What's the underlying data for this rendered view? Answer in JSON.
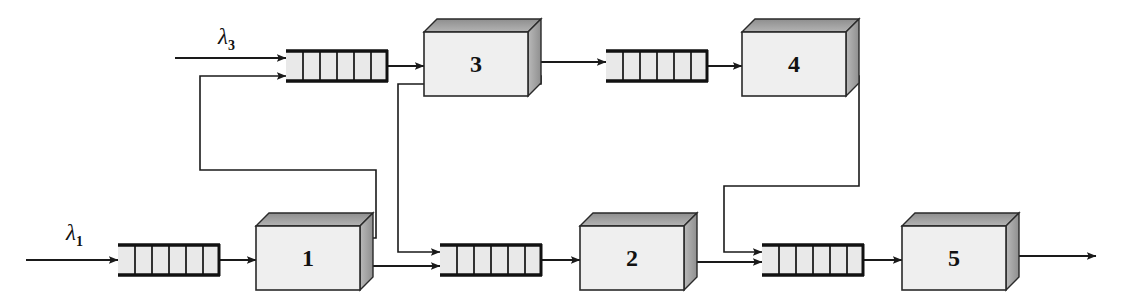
{
  "diagram": {
    "type": "queueing-network",
    "colors": {
      "line": "#1a1a1a",
      "server_face": "#efefef",
      "server_top": "#9a9a9a",
      "server_side": "#a8a8a8",
      "queue_fill": "#e9e9e9",
      "background": "#ffffff"
    },
    "arrivals": [
      {
        "id": "lambda3",
        "label": "λ",
        "subscript": "3",
        "x": 218,
        "y": 28
      },
      {
        "id": "lambda1",
        "label": "λ",
        "subscript": "1",
        "x": 66,
        "y": 224
      }
    ],
    "queues": [
      {
        "id": "queue3",
        "cells": 6,
        "x": 286,
        "y": 50,
        "width": 102,
        "height": 32
      },
      {
        "id": "queue4",
        "cells": 6,
        "x": 606,
        "y": 50,
        "width": 102,
        "height": 32
      },
      {
        "id": "queue1",
        "cells": 6,
        "x": 118,
        "y": 244,
        "width": 102,
        "height": 32
      },
      {
        "id": "queue2",
        "cells": 6,
        "x": 440,
        "y": 244,
        "width": 102,
        "height": 32
      },
      {
        "id": "queue5",
        "cells": 6,
        "x": 762,
        "y": 244,
        "width": 102,
        "height": 32
      }
    ],
    "servers": [
      {
        "id": "server3",
        "label": "3",
        "x": 424,
        "y": 32,
        "width": 104,
        "height": 64,
        "depth": 13
      },
      {
        "id": "server4",
        "label": "4",
        "x": 742,
        "y": 32,
        "width": 104,
        "height": 64,
        "depth": 13
      },
      {
        "id": "server1",
        "label": "1",
        "x": 256,
        "y": 226,
        "width": 104,
        "height": 64,
        "depth": 13
      },
      {
        "id": "server2",
        "label": "2",
        "x": 580,
        "y": 226,
        "width": 104,
        "height": 64,
        "depth": 13
      },
      {
        "id": "server5",
        "label": "5",
        "x": 902,
        "y": 226,
        "width": 104,
        "height": 64,
        "depth": 13
      }
    ],
    "flows": [
      {
        "id": "arrival3-to-queue3",
        "from": "lambda3",
        "to": "queue3"
      },
      {
        "id": "feedback1-to-queue3",
        "from": "server1",
        "to": "queue3"
      },
      {
        "id": "queue3-to-server3",
        "from": "queue3",
        "to": "server3"
      },
      {
        "id": "server3-to-queue4",
        "from": "server3",
        "to": "queue4"
      },
      {
        "id": "server3-to-queue2",
        "from": "server3",
        "to": "queue2"
      },
      {
        "id": "queue4-to-server4",
        "from": "queue4",
        "to": "server4"
      },
      {
        "id": "server4-to-queue5",
        "from": "server4",
        "to": "queue5"
      },
      {
        "id": "arrival1-to-queue1",
        "from": "lambda1",
        "to": "queue1"
      },
      {
        "id": "queue1-to-server1",
        "from": "queue1",
        "to": "server1"
      },
      {
        "id": "server1-to-queue2",
        "from": "server1",
        "to": "queue2"
      },
      {
        "id": "queue2-to-server2",
        "from": "queue2",
        "to": "server2"
      },
      {
        "id": "server2-to-queue5",
        "from": "server2",
        "to": "queue5"
      },
      {
        "id": "queue5-to-server5",
        "from": "queue5",
        "to": "server5"
      },
      {
        "id": "server5-to-exit",
        "from": "server5",
        "to": "exit"
      }
    ]
  }
}
